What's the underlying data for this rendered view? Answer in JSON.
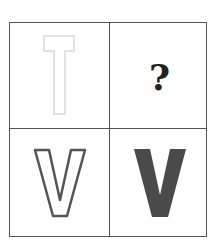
{
  "puzzle": {
    "cells": [
      {
        "position": "top-left",
        "content": "T",
        "style": "outline",
        "stroke_color": "#e2e2e2"
      },
      {
        "position": "top-right",
        "content": "?",
        "style": "question-mark",
        "color": "#222222"
      },
      {
        "position": "bottom-left",
        "content": "V",
        "style": "outline",
        "stroke_color": "#555555"
      },
      {
        "position": "bottom-right",
        "content": "V",
        "style": "solid",
        "fill_color": "#4a4a4a"
      }
    ],
    "question_mark": "?",
    "grid_color": "#555555"
  }
}
